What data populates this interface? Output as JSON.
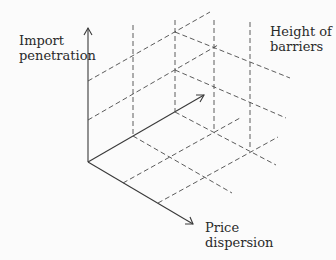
{
  "diagram": {
    "axes": {
      "vertical": {
        "label_line1": "Import",
        "label_line2": "penetration"
      },
      "depth": {
        "label_line1": "Height of",
        "label_line2": "barriers"
      },
      "horizontal": {
        "label_line1": "Price",
        "label_line2": "dispersion"
      }
    },
    "colors": {
      "line": "#3a3a3a",
      "dashed": "#4a4a4a",
      "text": "#2a2a2a",
      "background": "#fbfbfb"
    }
  }
}
